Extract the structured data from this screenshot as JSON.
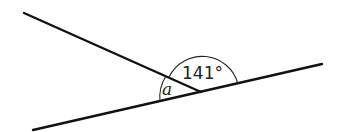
{
  "diagram": {
    "type": "intersecting-lines-angles",
    "lines": [
      {
        "name": "upper-line",
        "from": [
          24,
          13
        ],
        "to": [
          201,
          92
        ]
      },
      {
        "name": "lower-line",
        "from": [
          33,
          130
        ],
        "to": [
          322,
          64
        ]
      }
    ],
    "vertex": [
      201,
      92
    ],
    "angles": {
      "known": {
        "label": "141°",
        "value_degrees": 141
      },
      "unknown": {
        "label": "a"
      }
    },
    "colors": {
      "stroke": "#111111",
      "background": "#ffffff"
    }
  }
}
